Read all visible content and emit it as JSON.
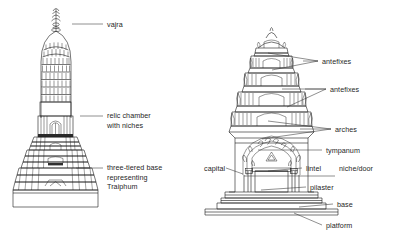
{
  "figure": {
    "type": "architectural line diagram",
    "background_color": "#ffffff",
    "ink_color": "#1a1a1a",
    "label_color": "#262626"
  },
  "left_diagram": {
    "name": "tapering-spire-prang",
    "labels": [
      {
        "id": "vajra",
        "text": "vajra",
        "x": 107,
        "y": 20,
        "leader": {
          "x1": 72,
          "y1": 24,
          "x2": 103,
          "y2": 24
        }
      },
      {
        "id": "relic-chamber",
        "text": "relic chamber",
        "text_line2": "with niches",
        "x": 107,
        "y": 111,
        "leader": {
          "x1": 80,
          "y1": 116,
          "x2": 103,
          "y2": 116
        }
      },
      {
        "id": "three-tiered-base",
        "text": "three-tiered base",
        "text_line2": "representing",
        "text_line3": "Traiphum",
        "line3_italic": true,
        "x": 107,
        "y": 163,
        "leader": {
          "x1": 76,
          "y1": 168,
          "x2": 103,
          "y2": 168
        }
      }
    ]
  },
  "right_diagram": {
    "name": "tiered-khmer-style-prang",
    "labels": [
      {
        "id": "antefixes-upper",
        "text": "antefixes",
        "x": 322,
        "y": 57,
        "leaders": [
          {
            "x1": 303,
            "y1": 61,
            "x2": 318,
            "y2": 61
          },
          {
            "x1": 268,
            "y1": 53,
            "x2": 318,
            "y2": 61
          },
          {
            "x1": 272,
            "y1": 70,
            "x2": 318,
            "y2": 61
          }
        ]
      },
      {
        "id": "antefixes-lower",
        "text": "antefixes",
        "x": 330,
        "y": 85,
        "leaders": [
          {
            "x1": 305,
            "y1": 89,
            "x2": 326,
            "y2": 89
          },
          {
            "x1": 280,
            "y1": 89,
            "x2": 326,
            "y2": 89
          },
          {
            "x1": 285,
            "y1": 105,
            "x2": 326,
            "y2": 89
          }
        ]
      },
      {
        "id": "arches",
        "text": "arches",
        "x": 335,
        "y": 125,
        "leaders": [
          {
            "x1": 300,
            "y1": 129,
            "x2": 331,
            "y2": 129
          },
          {
            "x1": 268,
            "y1": 120,
            "x2": 331,
            "y2": 129
          },
          {
            "x1": 262,
            "y1": 138,
            "x2": 331,
            "y2": 129
          }
        ]
      },
      {
        "id": "tympanum",
        "text": "tympanum",
        "x": 326,
        "y": 146,
        "leader": {
          "x1": 258,
          "y1": 150,
          "x2": 322,
          "y2": 150
        }
      },
      {
        "id": "capital",
        "text": "capital",
        "x": 204,
        "y": 164,
        "leader": {
          "x1": 226,
          "y1": 168,
          "x2": 243,
          "y2": 173
        }
      },
      {
        "id": "lintel",
        "text": "lintel",
        "x": 306,
        "y": 164,
        "leader": {
          "x1": 268,
          "y1": 170,
          "x2": 302,
          "y2": 168
        }
      },
      {
        "id": "niche-door",
        "text": "niche/door",
        "x": 339,
        "y": 164,
        "leader": {
          "x1": 244,
          "y1": 176,
          "x2": 335,
          "y2": 176
        }
      },
      {
        "id": "pilaster",
        "text": "pilaster",
        "x": 310,
        "y": 183,
        "leader": {
          "x1": 261,
          "y1": 190,
          "x2": 306,
          "y2": 187
        }
      },
      {
        "id": "base",
        "text": "base",
        "x": 337,
        "y": 200,
        "leader": {
          "x1": 299,
          "y1": 207,
          "x2": 333,
          "y2": 204
        }
      },
      {
        "id": "platform",
        "text": "platform",
        "x": 326,
        "y": 221,
        "leader": {
          "x1": 294,
          "y1": 213,
          "x2": 322,
          "y2": 225
        }
      }
    ]
  }
}
